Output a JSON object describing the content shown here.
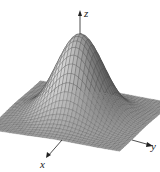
{
  "figure": {
    "title": "",
    "surface": "z = exp(-(x^2 + y^2))",
    "type": "3d-surface-mesh",
    "axes": {
      "z": {
        "label": "z"
      },
      "x": {
        "label": "x"
      },
      "y": {
        "label": "y"
      }
    },
    "colors": {
      "mesh_line": "#3a3a3a",
      "surface_light": "#d8d8d8",
      "surface_dark": "#5a5a5a",
      "axis": "#222222"
    },
    "grid": {
      "n": 36,
      "range": 2.2
    }
  }
}
